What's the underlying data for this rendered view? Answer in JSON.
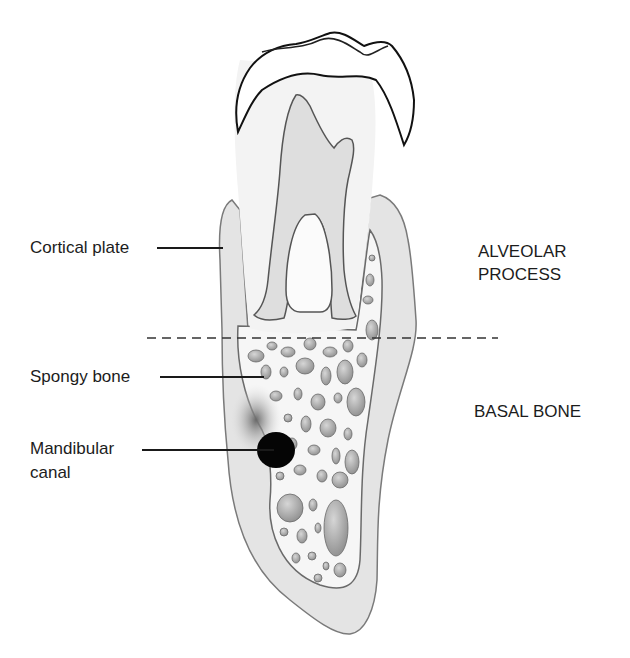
{
  "diagram": {
    "labels": {
      "cortical_plate": "Cortical plate",
      "spongy_bone": "Spongy bone",
      "mandibular_canal_line1": "Mandibular",
      "mandibular_canal_line2": "canal"
    },
    "regions": {
      "alveolar_process_line1": "ALVEOLAR",
      "alveolar_process_line2": "PROCESS",
      "basal_bone": "BASAL BONE"
    },
    "divider": {
      "style": "dashed",
      "description": "boundary between alveolar process and basal bone"
    },
    "colors": {
      "background": "#ffffff",
      "cortical_bone": "#e4e4e4",
      "spongy_bone_bg": "#f7f7f7",
      "marrow_spaces": "#a9a9a9",
      "tooth_enamel": "#ffffff",
      "pulp": "#dcdcdc",
      "canal": "#050505",
      "outline": "#555555"
    }
  }
}
